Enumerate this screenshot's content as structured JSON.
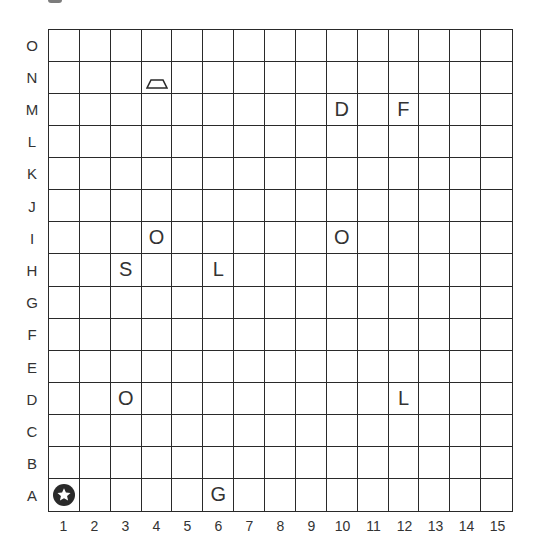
{
  "board": {
    "rows": [
      "O",
      "N",
      "M",
      "L",
      "K",
      "J",
      "I",
      "H",
      "G",
      "F",
      "E",
      "D",
      "C",
      "B",
      "A"
    ],
    "columns": [
      "1",
      "2",
      "3",
      "4",
      "5",
      "6",
      "7",
      "8",
      "9",
      "10",
      "11",
      "12",
      "13",
      "14",
      "15"
    ],
    "pieces": [
      {
        "row": "N",
        "col": 4,
        "type": "icon",
        "icon": "trapezoid-icon"
      },
      {
        "row": "M",
        "col": 10,
        "type": "letter",
        "text": "D"
      },
      {
        "row": "M",
        "col": 12,
        "type": "letter",
        "text": "F"
      },
      {
        "row": "I",
        "col": 4,
        "type": "letter",
        "text": "O"
      },
      {
        "row": "I",
        "col": 10,
        "type": "letter",
        "text": "O"
      },
      {
        "row": "H",
        "col": 3,
        "type": "letter",
        "text": "S"
      },
      {
        "row": "H",
        "col": 6,
        "type": "letter",
        "text": "L"
      },
      {
        "row": "D",
        "col": 3,
        "type": "letter",
        "text": "O"
      },
      {
        "row": "D",
        "col": 12,
        "type": "letter",
        "text": "L"
      },
      {
        "row": "A",
        "col": 1,
        "type": "icon",
        "icon": "star-circle-icon"
      },
      {
        "row": "A",
        "col": 6,
        "type": "letter",
        "text": "G"
      }
    ]
  },
  "colors": {
    "line": "#2a2a2a",
    "text": "#333333",
    "background": "#ffffff"
  }
}
